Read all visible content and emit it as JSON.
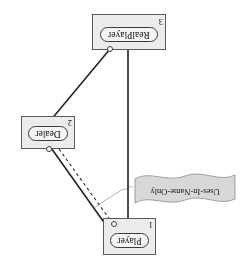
{
  "figure": {
    "type": "uml-object-diagram",
    "orientation": "rotated-180",
    "clipped_caption": "",
    "background_color": "#ffffff",
    "box_fill_color": "#ececed",
    "box_border_color": "#5a5a5a",
    "line_color": "#2b2b2b",
    "note_fill_color": "#d8d8d8"
  },
  "objects": [
    {
      "id": "player",
      "label": "Player",
      "number": "1",
      "icon": "socket-circle"
    },
    {
      "id": "dealer",
      "label": "Dealer",
      "number": "2",
      "icon": "socket-circle"
    },
    {
      "id": "realplayer",
      "label": "RealPlayer",
      "number": "3",
      "icon": "socket-circle"
    }
  ],
  "note": {
    "text": "Uses-In-Name-Only",
    "shape": "ribbon-banner"
  },
  "connections": [
    {
      "from": "realplayer",
      "to": "player",
      "style": "solid",
      "arrow": "open-arrowhead"
    },
    {
      "from": "dealer",
      "to": "player",
      "style": "dashed",
      "arrow": "none"
    },
    {
      "from": "player",
      "to": "dealer",
      "style": "solid",
      "arrow": "none"
    },
    {
      "from": "dealer",
      "to": "realplayer",
      "style": "solid",
      "arrow": "none"
    },
    {
      "from": "note",
      "to": "player",
      "style": "solid-thin-gray",
      "arrow": "none"
    }
  ]
}
